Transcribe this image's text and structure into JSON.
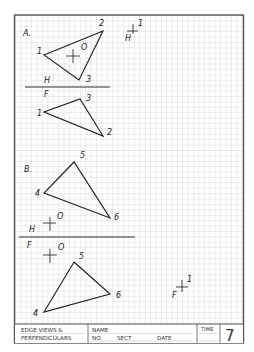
{
  "worksheet": {
    "title_line1": "EDGE VIEWS &",
    "title_line2": "PERPENDICULARS",
    "name_label": "NAME",
    "no_label": "NO.",
    "sect_label": "SECT",
    "date_label": "DATE",
    "time_label": "TIME",
    "sheet_number": "7"
  },
  "problem_a": {
    "label": "A.",
    "top_view": {
      "fold_label_top": "H",
      "points": [
        {
          "name": "1",
          "x": 44,
          "y": 55
        },
        {
          "name": "2",
          "x": 103,
          "y": 31
        },
        {
          "name": "3",
          "x": 79,
          "y": 80
        }
      ],
      "point_o": {
        "name": "O",
        "x": 73,
        "y": 56
      }
    },
    "fold_line": {
      "top_label": "H",
      "bottom_label": "F"
    },
    "front_view": {
      "points": [
        {
          "name": "1",
          "x": 44,
          "y": 112
        },
        {
          "name": "3",
          "x": 80,
          "y": 99
        },
        {
          "name": "2",
          "x": 103,
          "y": 136
        }
      ]
    },
    "aux_marker": {
      "point_label": "1",
      "view_label": "H"
    }
  },
  "problem_b": {
    "label": "B.",
    "top_view": {
      "points": [
        {
          "name": "5",
          "x": 74,
          "y": 162
        },
        {
          "name": "4",
          "x": 44,
          "y": 193
        },
        {
          "name": "6",
          "x": 110,
          "y": 218
        }
      ],
      "point_o": {
        "name": "O",
        "view_label": "H"
      }
    },
    "fold_line": {
      "top_label": "H",
      "bottom_label": "F"
    },
    "front_view": {
      "points": [
        {
          "name": "5",
          "x": 74,
          "y": 262
        },
        {
          "name": "6",
          "x": 110,
          "y": 294
        },
        {
          "name": "4",
          "x": 44,
          "y": 312
        }
      ],
      "point_o": {
        "name": "O"
      }
    },
    "aux_marker": {
      "point_label": "1",
      "view_label": "F"
    }
  },
  "colors": {
    "grid": "#c8c8c8",
    "border": "#555555",
    "ink": "#1a1a1a"
  }
}
